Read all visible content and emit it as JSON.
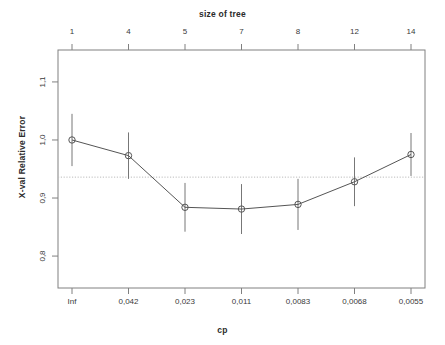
{
  "top_axis": {
    "title": "size of tree",
    "ticks": [
      "1",
      "4",
      "5",
      "7",
      "8",
      "12",
      "14"
    ]
  },
  "bottom_axis": {
    "title": "cp",
    "ticks": [
      "Inf",
      "0,042",
      "0,023",
      "0,011",
      "0,0083",
      "0,0068",
      "0,0055"
    ]
  },
  "y_axis": {
    "title": "X-val Relative Error",
    "ticks": [
      "1,1",
      "1,0",
      "0,9",
      "0,8"
    ]
  },
  "colors": {
    "line": "#555555",
    "frame": "#808080",
    "point": "#555555",
    "errorbar": "#777777",
    "reference_line": "#bbbbbb",
    "text": "#3a3a3a",
    "background": "#ffffff"
  },
  "chart_data": {
    "type": "line",
    "title": "size of tree",
    "xlabel": "cp",
    "ylabel": "X-val Relative Error",
    "grid": false,
    "legend": null,
    "ylim": [
      0.745,
      1.155
    ],
    "xlim": [
      0.5,
      7.5
    ],
    "y_ticks": [
      1.1,
      1.0,
      0.9,
      0.8
    ],
    "y_tick_labels": [
      "1,1",
      "1,0",
      "0,9",
      "0,8"
    ],
    "x_tick_labels_bottom": [
      "Inf",
      "0,042",
      "0,023",
      "0,011",
      "0,0083",
      "0,0068",
      "0,0055"
    ],
    "x_tick_labels_top": [
      "1",
      "4",
      "5",
      "7",
      "8",
      "12",
      "14"
    ],
    "tree_size": [
      1,
      4,
      5,
      7,
      8,
      12,
      14
    ],
    "cp": [
      "Inf",
      "0.042",
      "0.023",
      "0.011",
      "0.0083",
      "0.0068",
      "0.0055"
    ],
    "xerror": [
      1.0,
      0.973,
      0.884,
      0.881,
      0.889,
      0.928,
      0.975
    ],
    "errorbar_low": [
      0.955,
      0.933,
      0.842,
      0.838,
      0.845,
      0.886,
      0.938
    ],
    "errorbar_high": [
      1.045,
      1.013,
      0.926,
      0.924,
      0.933,
      0.97,
      1.012
    ],
    "reference_line": {
      "value": 0.936,
      "style": "dotted",
      "orientation": "horizontal"
    },
    "annotations": []
  }
}
